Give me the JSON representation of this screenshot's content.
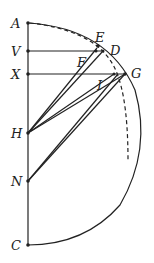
{
  "diagram": {
    "labels": {
      "A": "A",
      "V": "V",
      "X": "X",
      "H": "H",
      "N": "N",
      "C": "C",
      "E": "E",
      "D": "D",
      "F": "F",
      "G": "G",
      "I": "I"
    },
    "points": {
      "A": [
        28,
        23
      ],
      "V": [
        28,
        51
      ],
      "X": [
        28,
        74
      ],
      "H": [
        28,
        133
      ],
      "N": [
        28,
        181
      ],
      "C": [
        28,
        245
      ],
      "E": [
        98,
        46
      ],
      "D": [
        103,
        51
      ],
      "F": [
        95,
        51
      ],
      "G": [
        125,
        74
      ],
      "I": [
        114,
        74
      ]
    },
    "colors": {
      "stroke": "#222222"
    }
  }
}
